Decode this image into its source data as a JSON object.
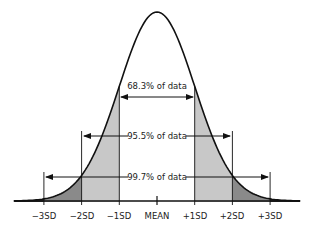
{
  "chart_data": {
    "type": "area",
    "title": "",
    "xlabel": "",
    "ylabel": "",
    "distribution": "normal",
    "categories": [
      "−3SD",
      "−2SD",
      "−1SD",
      "MEAN",
      "+1SD",
      "+2SD",
      "+3SD"
    ],
    "x_sd": [
      -3,
      -2,
      -1,
      0,
      1,
      2,
      3
    ],
    "xlim_sd": [
      -3.8,
      3.8
    ],
    "grid": false,
    "legend": null,
    "shaded_regions": [
      {
        "from_sd": -1,
        "to_sd": 1,
        "fill": "#ffffff",
        "label": "within 1 SD"
      },
      {
        "from_sd": -2,
        "to_sd": -1,
        "fill": "#c8c8c8",
        "label": "1-2 SD"
      },
      {
        "from_sd": 1,
        "to_sd": 2,
        "fill": "#c8c8c8",
        "label": "1-2 SD"
      },
      {
        "from_sd": -3,
        "to_sd": -2,
        "fill": "#8a8a8a",
        "label": "2-3 SD"
      },
      {
        "from_sd": 2,
        "to_sd": 3,
        "fill": "#8a8a8a",
        "label": "2-3 SD"
      },
      {
        "from_sd": -3.8,
        "to_sd": -3,
        "fill": "#333333",
        "label": "beyond 3 SD"
      },
      {
        "from_sd": 3,
        "to_sd": 3.8,
        "fill": "#333333",
        "label": "beyond 3 SD"
      }
    ],
    "annotations": [
      {
        "text": "68.3% of data",
        "from_sd": -1,
        "to_sd": 1,
        "value_pct": 68.3
      },
      {
        "text": "95.5% of data",
        "from_sd": -2,
        "to_sd": 2,
        "value_pct": 95.5
      },
      {
        "text": "99.7% of data",
        "from_sd": -3,
        "to_sd": 3,
        "value_pct": 99.7
      }
    ]
  },
  "labels": {
    "minus3": "−3SD",
    "minus2": "−2SD",
    "minus1": "−1SD",
    "mean": "MEAN",
    "plus1": "+1SD",
    "plus2": "+2SD",
    "plus3": "+3SD"
  },
  "annotations": {
    "one_sd": "68.3% of data",
    "two_sd": "95.5% of data",
    "three_sd": "99.7% of data"
  }
}
